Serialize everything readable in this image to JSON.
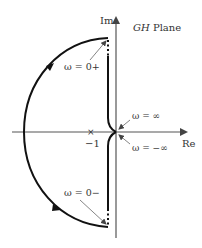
{
  "diagram": {
    "title": "GH Plane",
    "title_italic": "GH",
    "title_rest": " Plane",
    "axes": {
      "real_label": "Re",
      "imag_label": "Im"
    },
    "critical_point": {
      "marker": "×",
      "label": "−1"
    },
    "annotations": {
      "omega_zero_plus": "ω = 0+",
      "omega_zero_minus": "ω = 0−",
      "omega_inf": "ω = ∞",
      "omega_neg_inf": "ω = −∞"
    },
    "colors": {
      "curve": "#111111",
      "axis": "#555555",
      "leader": "#666666"
    }
  }
}
